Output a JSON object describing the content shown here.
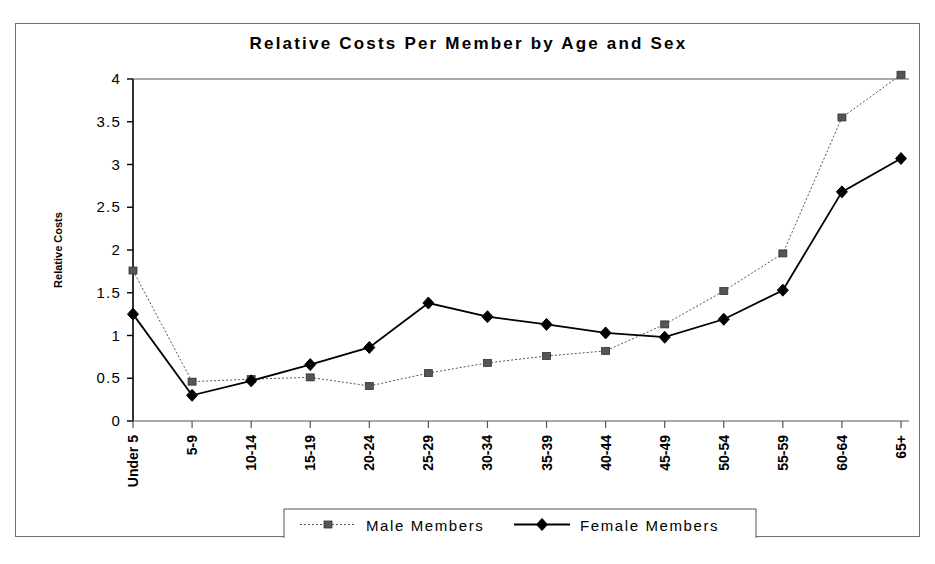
{
  "chart_data": {
    "type": "line",
    "title": "Relative Costs Per Member by Age and Sex",
    "xlabel": "",
    "ylabel": "Relative Costs",
    "categories": [
      "Under 5",
      "5-9",
      "10-14",
      "15-19",
      "20-24",
      "25-29",
      "30-34",
      "35-39",
      "40-44",
      "45-49",
      "50-54",
      "55-59",
      "60-64",
      "65+"
    ],
    "ylim": [
      0,
      4
    ],
    "yticks": [
      "0",
      "0.5",
      "1",
      "1.5",
      "2",
      "2.5",
      "3",
      "3.5",
      "4"
    ],
    "ytick_values": [
      0,
      0.5,
      1,
      1.5,
      2,
      2.5,
      3,
      3.5,
      4
    ],
    "grid": false,
    "legend_position": "bottom",
    "series": [
      {
        "name": "Male Members",
        "marker": "square",
        "line_style": "dotted",
        "color": "#555555",
        "values": [
          1.76,
          0.46,
          0.49,
          0.51,
          0.41,
          0.56,
          0.68,
          0.76,
          0.82,
          1.13,
          1.52,
          1.96,
          3.55,
          4.05
        ]
      },
      {
        "name": "Female Members",
        "marker": "diamond",
        "line_style": "solid",
        "color": "#000000",
        "values": [
          1.25,
          0.3,
          0.47,
          0.66,
          0.86,
          1.38,
          1.22,
          1.13,
          1.03,
          0.98,
          1.19,
          1.53,
          2.68,
          3.07
        ]
      }
    ]
  },
  "legend": {
    "items": [
      {
        "label": "Male Members"
      },
      {
        "label": "Female Members"
      }
    ]
  }
}
